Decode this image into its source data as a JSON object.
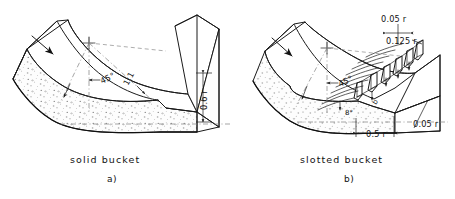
{
  "figure": {
    "kind": "engineering-diagram",
    "background_color": "#ffffff",
    "line_color": "#1a1a1a",
    "centerline_color": "#808080",
    "concrete_fill": "#fbfbfb",
    "stipple_color": "#5a5a5a"
  },
  "panels": [
    {
      "id": "a",
      "caption": "solid bucket",
      "sublabel": "a)",
      "annotations": [
        {
          "name": "bucket-angle",
          "text": "45°"
        },
        {
          "name": "slope-ratio",
          "text": "1:1"
        },
        {
          "name": "lip-height",
          "text": "0.6 r"
        }
      ],
      "flow_arrow": {
        "name": "flow-arrow",
        "direction": "down-right"
      }
    },
    {
      "id": "b",
      "caption": "slotted bucket",
      "sublabel": "b)",
      "annotations": [
        {
          "name": "tooth-gap",
          "text": "0.05 r"
        },
        {
          "name": "tooth-height",
          "text": "0.125 r"
        },
        {
          "name": "tooth-width",
          "text": "0.5 r"
        },
        {
          "name": "apron-thickness",
          "text": "0.05 r"
        },
        {
          "name": "bucket-angle",
          "text": "45°"
        },
        {
          "name": "tooth-slope-angle",
          "text": "8°"
        },
        {
          "name": "tooth-spacing-symbol",
          "text": "b"
        }
      ],
      "flow_arrow": {
        "name": "flow-arrow",
        "direction": "down-right"
      }
    }
  ],
  "captions": {
    "left_title": "solid bucket",
    "left_sub": "a)",
    "right_title": "slotted bucket",
    "right_sub": "b)"
  },
  "labels": {
    "angle_45_a": "45°",
    "ratio_1_1": "1:1",
    "height_06r": "0.6 r",
    "gap_005r": "0.05 r",
    "height_0125r": "0.125 r",
    "width_05r": "0.5 r",
    "thick_005r": "0.05 r",
    "angle_45_b": "45°",
    "angle_8": "8°",
    "symbol_b": "b"
  }
}
